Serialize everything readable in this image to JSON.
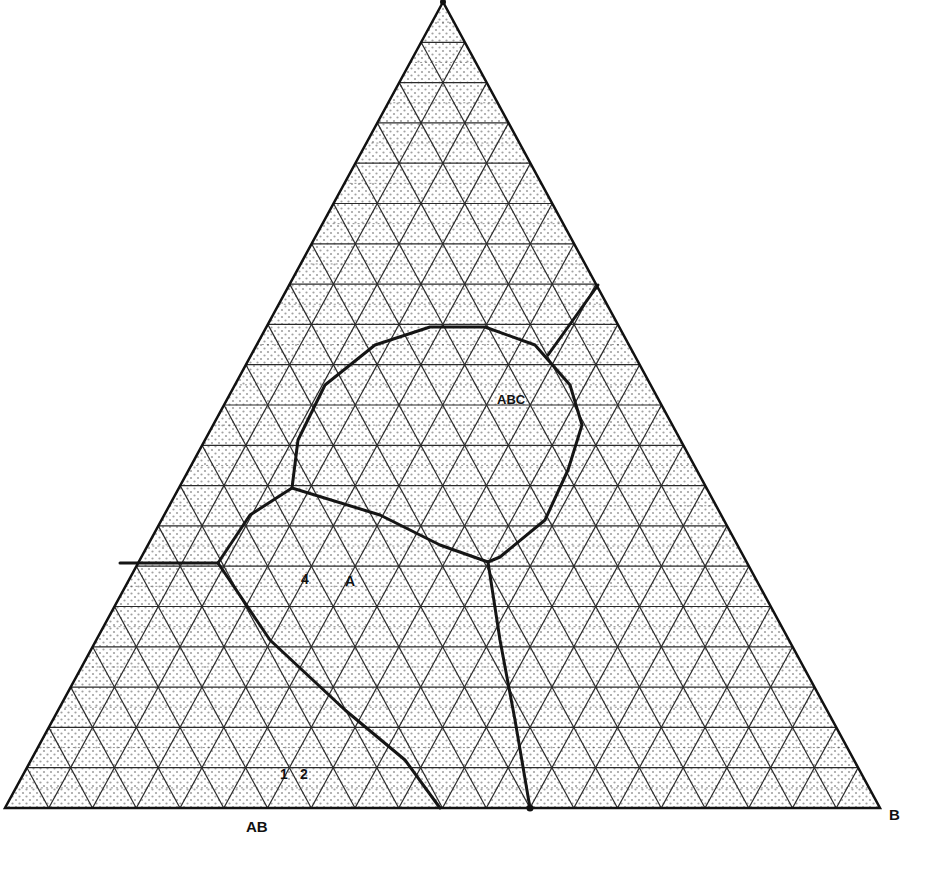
{
  "diagram": {
    "type": "ternary-phase-diagram",
    "grid_divisions": 20,
    "colors": {
      "line": "#1a1a1a",
      "grid": "#2a2a2a",
      "stipple": "#555555",
      "background": "#ffffff"
    },
    "vertices": {
      "top": [
        443,
        2
      ],
      "left": [
        5,
        808
      ],
      "right": [
        880,
        808
      ]
    },
    "labels": {
      "ab": "AB",
      "b": "B",
      "abc": "ABC",
      "region_4": "4",
      "region_a": "A",
      "region_1": "1",
      "region_2": "2"
    },
    "boundaries": [
      {
        "name": "abc-field-loop",
        "points": [
          [
            292,
            488
          ],
          [
            298,
            440
          ],
          [
            325,
            385
          ],
          [
            375,
            345
          ],
          [
            430,
            327
          ],
          [
            485,
            327
          ],
          [
            535,
            345
          ],
          [
            570,
            385
          ],
          [
            582,
            425
          ],
          [
            568,
            470
          ],
          [
            545,
            520
          ],
          [
            500,
            557
          ],
          [
            488,
            562
          ],
          [
            440,
            545
          ],
          [
            380,
            515
          ],
          [
            292,
            488
          ]
        ]
      },
      {
        "name": "abc-to-right-edge",
        "points": [
          [
            548,
            355
          ],
          [
            598,
            285
          ]
        ]
      },
      {
        "name": "left-field-upper",
        "points": [
          [
            292,
            488
          ],
          [
            250,
            515
          ],
          [
            218,
            563
          ]
        ]
      },
      {
        "name": "left-edge-to-junction",
        "points": [
          [
            120,
            563
          ],
          [
            218,
            563
          ]
        ]
      },
      {
        "name": "left-field-lower",
        "points": [
          [
            218,
            563
          ],
          [
            270,
            640
          ],
          [
            345,
            710
          ],
          [
            405,
            760
          ],
          [
            440,
            808
          ]
        ]
      },
      {
        "name": "central-vertical",
        "points": [
          [
            488,
            562
          ],
          [
            500,
            640
          ],
          [
            515,
            720
          ],
          [
            530,
            808
          ]
        ]
      }
    ]
  }
}
